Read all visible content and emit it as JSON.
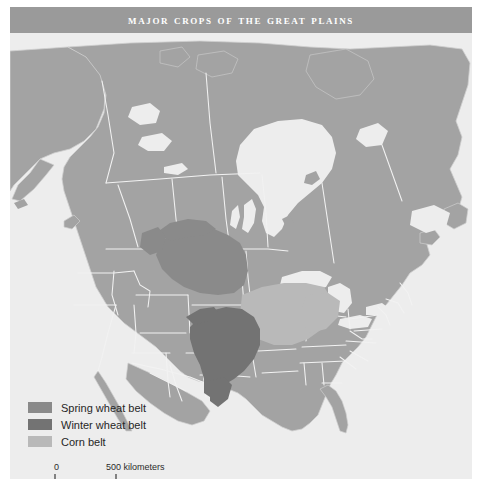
{
  "figure": {
    "title": "Major Crops of the Great Plains",
    "background_color": "#d9d9d9",
    "title_band_color": "#9a9a9a",
    "title_text_color": "#ffffff"
  },
  "map": {
    "ocean_color": "#ededed",
    "land_color": "#a3a3a3",
    "border_color": "#f2f2f2",
    "coast_color": "#cfcfcf",
    "regions": [
      {
        "name": "spring-wheat-belt",
        "label": "Spring wheat belt",
        "color": "#8a8a8a"
      },
      {
        "name": "winter-wheat-belt",
        "label": "Winter wheat belt",
        "color": "#737373"
      },
      {
        "name": "corn-belt",
        "label": "Corn belt",
        "color": "#b9b9b9"
      }
    ]
  },
  "legend": {
    "items": [
      {
        "label": "Spring wheat belt",
        "color": "#8a8a8a"
      },
      {
        "label": "Winter wheat belt",
        "color": "#737373"
      },
      {
        "label": "Corn belt",
        "color": "#b9b9b9"
      }
    ]
  },
  "scale": {
    "zero_label": "0",
    "max_label": "500 kilometers",
    "units": "kilometers",
    "max_value": "500"
  }
}
